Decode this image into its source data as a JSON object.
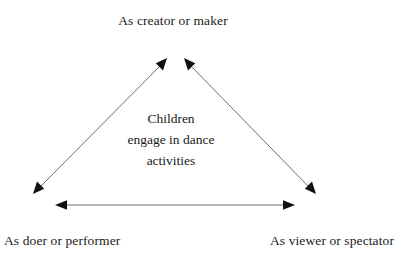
{
  "diagram": {
    "type": "triangle-relationship-diagram",
    "background_color": "#ffffff",
    "text_color": "#1a1a1a",
    "line_color": "#6e6e6e",
    "arrowhead_color": "#111111",
    "vertices": {
      "top_label": "As creator or maker",
      "bottom_left_label": "As doer or performer",
      "bottom_right_label": "As viewer or spectator"
    },
    "center": {
      "line1": "Children",
      "line2": "engage in dance",
      "line3": "activities"
    },
    "connectors": [
      {
        "name": "left-diagonal-arrow",
        "from": "As doer or performer",
        "to": "As creator or maker",
        "double_headed": true
      },
      {
        "name": "right-diagonal-arrow",
        "from": "As creator or maker",
        "to": "As viewer or spectator",
        "double_headed": true
      },
      {
        "name": "bottom-horizontal-arrow",
        "from": "As doer or performer",
        "to": "As viewer or spectator",
        "double_headed": true
      }
    ]
  }
}
